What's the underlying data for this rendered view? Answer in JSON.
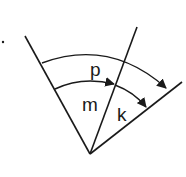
{
  "diagram": {
    "type": "angle-diagram",
    "labels": {
      "outer_arc": "p",
      "inner_left_angle": "m",
      "inner_right_angle": "k"
    },
    "colors": {
      "stroke": "#1a1a1a",
      "background": "#ffffff"
    }
  }
}
